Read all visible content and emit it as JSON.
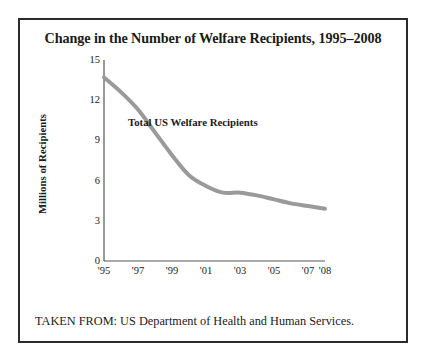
{
  "figure": {
    "title": "Change in the Number of Welfare Recipients, 1995–2008",
    "source_note": "TAKEN FROM: US Department of Health and Human Services.",
    "border_color": "#2b2b2b",
    "background": "#ffffff"
  },
  "chart_data": {
    "type": "line",
    "title": "Change in the Number of Welfare Recipients, 1995–2008",
    "xlabel": "",
    "ylabel": "Millions of Recipients",
    "x": [
      1995,
      1996,
      1997,
      1998,
      1999,
      2000,
      2001,
      2002,
      2003,
      2004,
      2005,
      2006,
      2007,
      2008
    ],
    "x_tick_values": [
      1995,
      1997,
      1999,
      2001,
      2003,
      2005,
      2007,
      2008
    ],
    "x_tick_labels": [
      "'95",
      "'97",
      "'99",
      "'01",
      "'03",
      "'05",
      "'07",
      "'08"
    ],
    "xlim": [
      1995,
      2008
    ],
    "y_ticks": [
      0,
      3,
      6,
      9,
      12,
      15
    ],
    "y_tick_labels": [
      "0",
      "3",
      "6",
      "9",
      "12",
      "15"
    ],
    "ylim": [
      0,
      15
    ],
    "grid": false,
    "legend": "none",
    "series": [
      {
        "name": "Total US Welfare Recipients",
        "color": "#9a9a9a",
        "line_width": 4,
        "values": [
          13.7,
          12.6,
          11.3,
          9.6,
          7.9,
          6.4,
          5.6,
          5.1,
          5.1,
          4.9,
          4.6,
          4.3,
          4.1,
          3.9
        ]
      }
    ],
    "annotations": [
      {
        "text": "Total US Welfare Recipients",
        "x": 2001,
        "y": 10.3
      }
    ]
  }
}
